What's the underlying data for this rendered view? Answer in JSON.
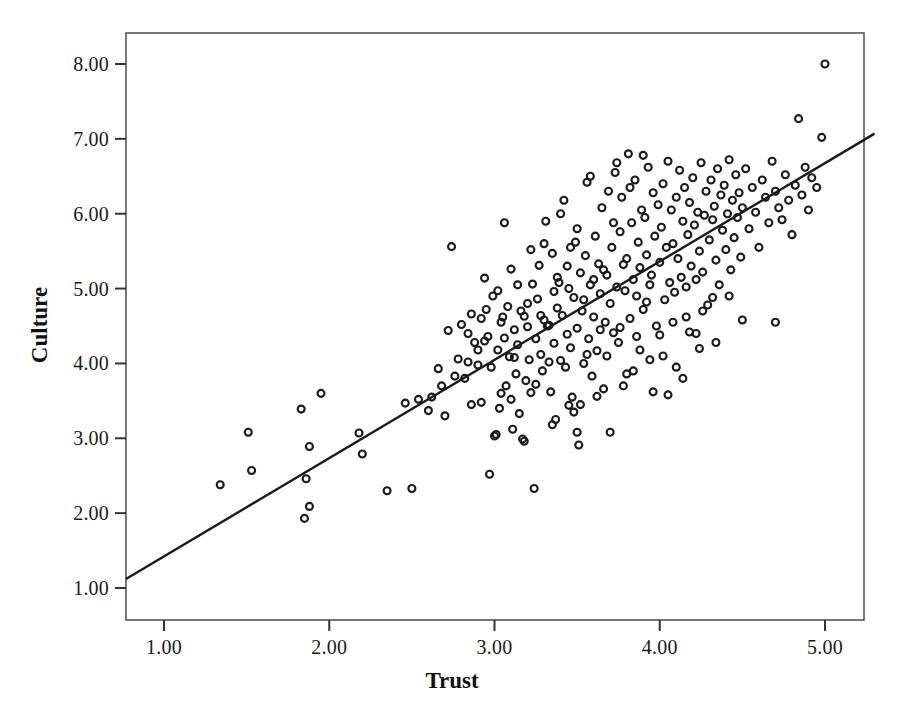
{
  "chart_data": {
    "type": "scatter",
    "title": "",
    "xlabel": "Trust",
    "ylabel": "Culture",
    "xlim": [
      0.75,
      5.3
    ],
    "ylim": [
      0.6,
      8.45
    ],
    "xticks": [
      1.0,
      2.0,
      3.0,
      4.0,
      5.0
    ],
    "xtick_labels": [
      "1.00",
      "2.00",
      "3.00",
      "4.00",
      "5.00"
    ],
    "yticks": [
      1.0,
      2.0,
      3.0,
      4.0,
      5.0,
      6.0,
      7.0,
      8.0
    ],
    "ytick_labels": [
      "1.00",
      "2.00",
      "3.00",
      "4.00",
      "5.00",
      "6.00",
      "7.00",
      "8.00"
    ],
    "grid": false,
    "legend": "none",
    "marker": "open-circle",
    "marker_color": "#1a1a1a",
    "marker_fill": "none",
    "marker_size": 7,
    "frame_color": "#555555",
    "fit_line": {
      "type": "linear-regression",
      "color": "#1a1a1a",
      "width": 2.4,
      "x_start": 0.77,
      "y_start": 1.12,
      "x_end": 5.3,
      "y_end": 7.07,
      "slope": 1.314,
      "intercept": 0.108
    },
    "n_points": 268,
    "points": [
      [
        1.34,
        2.38
      ],
      [
        1.51,
        3.08
      ],
      [
        1.53,
        2.57
      ],
      [
        1.85,
        1.93
      ],
      [
        1.88,
        2.09
      ],
      [
        1.86,
        2.46
      ],
      [
        1.88,
        2.89
      ],
      [
        1.83,
        3.39
      ],
      [
        1.95,
        3.6
      ],
      [
        2.18,
        3.07
      ],
      [
        2.2,
        2.79
      ],
      [
        2.35,
        2.3
      ],
      [
        2.46,
        3.47
      ],
      [
        2.5,
        2.33
      ],
      [
        2.54,
        3.52
      ],
      [
        2.6,
        3.37
      ],
      [
        2.62,
        3.55
      ],
      [
        2.66,
        3.93
      ],
      [
        2.68,
        3.7
      ],
      [
        2.7,
        3.3
      ],
      [
        2.72,
        4.44
      ],
      [
        2.74,
        5.56
      ],
      [
        2.76,
        3.83
      ],
      [
        2.78,
        4.06
      ],
      [
        2.8,
        4.52
      ],
      [
        2.82,
        3.8
      ],
      [
        2.84,
        4.4
      ],
      [
        2.86,
        3.45
      ],
      [
        2.88,
        4.28
      ],
      [
        2.9,
        3.98
      ],
      [
        2.92,
        4.6
      ],
      [
        2.94,
        5.14
      ],
      [
        2.95,
        4.72
      ],
      [
        2.96,
        4.36
      ],
      [
        2.97,
        2.52
      ],
      [
        2.98,
        3.95
      ],
      [
        2.99,
        4.9
      ],
      [
        3.0,
        3.03
      ],
      [
        3.01,
        3.05
      ],
      [
        3.02,
        4.18
      ],
      [
        3.03,
        3.4
      ],
      [
        3.04,
        4.55
      ],
      [
        3.05,
        4.62
      ],
      [
        3.06,
        5.88
      ],
      [
        3.07,
        3.7
      ],
      [
        3.08,
        4.76
      ],
      [
        3.09,
        4.09
      ],
      [
        3.1,
        5.26
      ],
      [
        3.11,
        3.12
      ],
      [
        3.12,
        4.45
      ],
      [
        3.13,
        3.86
      ],
      [
        3.14,
        4.25
      ],
      [
        3.15,
        3.33
      ],
      [
        3.16,
        4.7
      ],
      [
        3.17,
        2.99
      ],
      [
        3.18,
        2.96
      ],
      [
        3.19,
        3.77
      ],
      [
        3.2,
        4.49
      ],
      [
        3.21,
        4.05
      ],
      [
        3.22,
        3.61
      ],
      [
        3.23,
        5.06
      ],
      [
        3.24,
        2.33
      ],
      [
        3.25,
        4.33
      ],
      [
        3.26,
        4.86
      ],
      [
        3.27,
        5.31
      ],
      [
        3.28,
        4.12
      ],
      [
        3.29,
        3.9
      ],
      [
        3.3,
        4.58
      ],
      [
        3.31,
        5.9
      ],
      [
        3.32,
        4.5
      ],
      [
        3.33,
        4.51
      ],
      [
        3.34,
        3.62
      ],
      [
        3.35,
        5.47
      ],
      [
        3.36,
        4.27
      ],
      [
        3.37,
        3.25
      ],
      [
        3.38,
        4.74
      ],
      [
        3.39,
        5.08
      ],
      [
        3.4,
        4.04
      ],
      [
        3.41,
        4.64
      ],
      [
        3.42,
        6.18
      ],
      [
        3.43,
        3.95
      ],
      [
        3.44,
        4.39
      ],
      [
        3.45,
        5.0
      ],
      [
        3.46,
        4.21
      ],
      [
        3.47,
        3.55
      ],
      [
        3.48,
        4.88
      ],
      [
        3.49,
        5.62
      ],
      [
        3.5,
        4.47
      ],
      [
        3.5,
        3.08
      ],
      [
        3.51,
        2.91
      ],
      [
        3.52,
        5.21
      ],
      [
        3.53,
        4.7
      ],
      [
        3.54,
        4.0
      ],
      [
        3.55,
        5.44
      ],
      [
        3.56,
        6.42
      ],
      [
        3.57,
        4.33
      ],
      [
        3.58,
        5.05
      ],
      [
        3.59,
        3.83
      ],
      [
        3.6,
        4.62
      ],
      [
        3.61,
        5.7
      ],
      [
        3.62,
        4.17
      ],
      [
        3.63,
        5.33
      ],
      [
        3.64,
        4.93
      ],
      [
        3.65,
        6.08
      ],
      [
        3.66,
        3.66
      ],
      [
        3.67,
        4.55
      ],
      [
        3.68,
        5.18
      ],
      [
        3.69,
        6.3
      ],
      [
        3.7,
        4.8
      ],
      [
        3.71,
        5.55
      ],
      [
        3.72,
        4.41
      ],
      [
        3.73,
        6.55
      ],
      [
        3.74,
        5.02
      ],
      [
        3.75,
        4.28
      ],
      [
        3.76,
        5.76
      ],
      [
        3.77,
        6.22
      ],
      [
        3.78,
        3.7
      ],
      [
        3.79,
        4.97
      ],
      [
        3.8,
        5.4
      ],
      [
        3.81,
        6.8
      ],
      [
        3.82,
        4.6
      ],
      [
        3.83,
        5.88
      ],
      [
        3.84,
        5.12
      ],
      [
        3.85,
        6.45
      ],
      [
        3.86,
        4.36
      ],
      [
        3.87,
        5.62
      ],
      [
        3.88,
        5.28
      ],
      [
        3.89,
        6.05
      ],
      [
        3.9,
        4.72
      ],
      [
        3.91,
        5.95
      ],
      [
        3.92,
        5.45
      ],
      [
        3.93,
        6.62
      ],
      [
        3.94,
        4.05
      ],
      [
        3.95,
        5.18
      ],
      [
        3.96,
        6.28
      ],
      [
        3.97,
        5.7
      ],
      [
        3.98,
        4.5
      ],
      [
        3.99,
        6.12
      ],
      [
        4.0,
        5.35
      ],
      [
        4.01,
        5.82
      ],
      [
        4.02,
        6.4
      ],
      [
        4.03,
        4.85
      ],
      [
        4.04,
        5.55
      ],
      [
        4.05,
        6.7
      ],
      [
        4.06,
        5.08
      ],
      [
        4.07,
        6.05
      ],
      [
        4.08,
        5.6
      ],
      [
        4.09,
        4.95
      ],
      [
        4.1,
        6.22
      ],
      [
        4.11,
        5.4
      ],
      [
        4.12,
        6.58
      ],
      [
        4.13,
        5.15
      ],
      [
        4.14,
        5.9
      ],
      [
        4.15,
        6.35
      ],
      [
        4.16,
        4.62
      ],
      [
        4.17,
        5.72
      ],
      [
        4.18,
        6.15
      ],
      [
        4.19,
        5.3
      ],
      [
        4.2,
        6.48
      ],
      [
        4.21,
        5.85
      ],
      [
        4.22,
        4.4
      ],
      [
        4.23,
        6.02
      ],
      [
        4.24,
        5.5
      ],
      [
        4.25,
        6.68
      ],
      [
        4.26,
        5.22
      ],
      [
        4.27,
        5.98
      ],
      [
        4.28,
        6.3
      ],
      [
        4.29,
        4.78
      ],
      [
        4.3,
        5.65
      ],
      [
        4.31,
        6.45
      ],
      [
        4.32,
        5.92
      ],
      [
        4.33,
        6.1
      ],
      [
        4.34,
        5.38
      ],
      [
        4.35,
        6.6
      ],
      [
        4.36,
        5.05
      ],
      [
        4.37,
        6.25
      ],
      [
        4.38,
        5.78
      ],
      [
        4.39,
        6.38
      ],
      [
        4.4,
        5.52
      ],
      [
        4.41,
        6.0
      ],
      [
        4.42,
        6.72
      ],
      [
        4.43,
        5.25
      ],
      [
        4.44,
        6.18
      ],
      [
        4.45,
        5.68
      ],
      [
        4.46,
        6.52
      ],
      [
        4.47,
        5.95
      ],
      [
        4.48,
        6.28
      ],
      [
        4.49,
        5.42
      ],
      [
        4.5,
        6.08
      ],
      [
        4.52,
        6.6
      ],
      [
        4.54,
        5.8
      ],
      [
        4.56,
        6.35
      ],
      [
        4.58,
        6.02
      ],
      [
        4.6,
        5.55
      ],
      [
        4.62,
        6.45
      ],
      [
        4.64,
        6.22
      ],
      [
        4.66,
        5.88
      ],
      [
        4.68,
        6.7
      ],
      [
        4.7,
        4.55
      ],
      [
        4.7,
        6.3
      ],
      [
        4.72,
        6.08
      ],
      [
        4.74,
        5.92
      ],
      [
        4.76,
        6.52
      ],
      [
        4.78,
        6.18
      ],
      [
        4.8,
        5.72
      ],
      [
        4.82,
        6.38
      ],
      [
        4.84,
        7.27
      ],
      [
        4.86,
        6.25
      ],
      [
        4.88,
        6.62
      ],
      [
        4.9,
        6.05
      ],
      [
        4.92,
        6.48
      ],
      [
        4.95,
        6.35
      ],
      [
        4.98,
        7.02
      ],
      [
        5.0,
        8.0
      ],
      [
        3.02,
        4.97
      ],
      [
        3.18,
        4.63
      ],
      [
        3.33,
        4.02
      ],
      [
        3.45,
        3.44
      ],
      [
        3.56,
        4.12
      ],
      [
        3.62,
        3.56
      ],
      [
        3.7,
        3.08
      ],
      [
        3.8,
        3.86
      ],
      [
        3.88,
        4.18
      ],
      [
        3.96,
        3.62
      ],
      [
        4.02,
        4.1
      ],
      [
        4.1,
        3.95
      ],
      [
        4.18,
        4.42
      ],
      [
        4.26,
        4.7
      ],
      [
        4.34,
        4.28
      ],
      [
        4.42,
        4.9
      ],
      [
        4.5,
        4.58
      ],
      [
        3.25,
        3.72
      ],
      [
        3.35,
        3.18
      ],
      [
        3.48,
        3.35
      ],
      [
        2.9,
        4.18
      ],
      [
        2.86,
        4.66
      ],
      [
        2.94,
        4.3
      ],
      [
        3.06,
        4.34
      ],
      [
        3.12,
        4.08
      ],
      [
        3.2,
        4.8
      ],
      [
        3.28,
        4.64
      ],
      [
        3.36,
        4.96
      ],
      [
        3.44,
        5.3
      ],
      [
        3.52,
        3.45
      ],
      [
        3.6,
        5.12
      ],
      [
        3.68,
        4.1
      ],
      [
        3.76,
        4.48
      ],
      [
        3.84,
        3.9
      ],
      [
        3.92,
        4.82
      ],
      [
        4.0,
        4.38
      ],
      [
        4.08,
        4.55
      ],
      [
        4.16,
        5.02
      ],
      [
        4.24,
        4.2
      ],
      [
        4.32,
        4.88
      ],
      [
        2.84,
        4.02
      ],
      [
        3.1,
        3.52
      ],
      [
        3.3,
        5.6
      ],
      [
        3.4,
        6.0
      ],
      [
        3.5,
        5.8
      ],
      [
        3.58,
        6.5
      ],
      [
        3.66,
        5.25
      ],
      [
        3.74,
        6.68
      ],
      [
        3.82,
        6.35
      ],
      [
        3.9,
        6.78
      ],
      [
        4.05,
        3.58
      ],
      [
        4.14,
        3.8
      ],
      [
        4.22,
        5.12
      ],
      [
        3.94,
        5.05
      ],
      [
        3.86,
        4.9
      ],
      [
        3.78,
        5.32
      ],
      [
        3.72,
        5.88
      ],
      [
        3.64,
        4.45
      ],
      [
        3.54,
        4.85
      ],
      [
        3.46,
        5.55
      ],
      [
        3.38,
        5.15
      ],
      [
        3.22,
        5.52
      ],
      [
        3.14,
        5.05
      ],
      [
        3.04,
        3.6
      ],
      [
        2.92,
        3.48
      ]
    ]
  },
  "frame": {
    "left_px": 126,
    "right_px": 864,
    "top_px": 33,
    "bottom_px": 620
  }
}
